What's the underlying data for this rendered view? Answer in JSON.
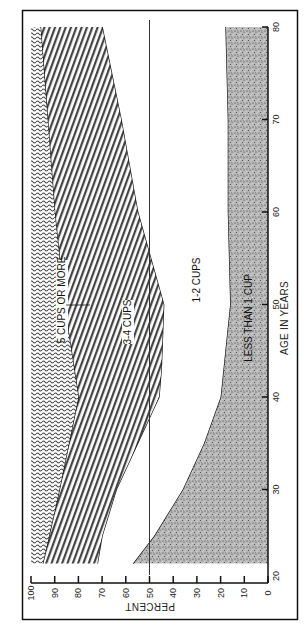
{
  "chart_data": {
    "type": "area",
    "stacked": true,
    "orientation": "rotated-90-ccw",
    "title": "",
    "xlabel": "AGE IN YEARS",
    "ylabel": "PERCENT",
    "xlim": [
      20,
      80
    ],
    "ylim": [
      0,
      100
    ],
    "x_ticks": [
      20,
      30,
      40,
      50,
      60,
      70,
      80
    ],
    "y_ticks": [
      0,
      10,
      20,
      30,
      40,
      50,
      60,
      70,
      80,
      90,
      100
    ],
    "grid": false,
    "reference_line": {
      "axis": "y",
      "value": 50
    },
    "legend": null,
    "series": [
      {
        "name": "LESS THAN 1 CUP",
        "pattern": "stipple",
        "upper_boundary": {
          "x": [
            22,
            25,
            30,
            35,
            40,
            45,
            50,
            60,
            70,
            80
          ],
          "y": [
            57,
            48,
            36,
            27,
            20,
            18,
            16,
            17,
            17,
            18
          ]
        }
      },
      {
        "name": "1-2 CUPS",
        "pattern": "none",
        "upper_boundary": {
          "x": [
            22,
            25,
            30,
            35,
            40,
            43,
            50,
            60,
            70,
            80
          ],
          "y": [
            72,
            70,
            64,
            55,
            46,
            45,
            44,
            55,
            62,
            70
          ]
        }
      },
      {
        "name": "3-4 CUPS",
        "pattern": "diagonal-lines",
        "upper_boundary": {
          "x": [
            22,
            30,
            40,
            50,
            60,
            70,
            80
          ],
          "y": [
            95,
            88,
            80,
            86,
            90,
            93,
            96
          ]
        }
      },
      {
        "name": "5 CUPS OR MORE",
        "pattern": "wavy-lines",
        "upper_boundary": {
          "x": [
            22,
            80
          ],
          "y": [
            100,
            100
          ]
        }
      }
    ]
  },
  "labels": {
    "x_axis_title": "AGE IN YEARS",
    "y_axis_title": "PERCENT",
    "less_than_1": "LESS THAN 1 CUP",
    "one_two": "1-2 CUPS",
    "three_four": "3-4 CUPS",
    "five_more": "5 CUPS OR MORE"
  }
}
